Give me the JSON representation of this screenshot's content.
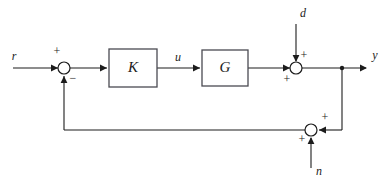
{
  "diagram": {
    "stroke_color": "#1c1c1c",
    "block_border_color": "#4a4a52",
    "background_color": "#ffffff",
    "blocks": [
      {
        "id": "controller",
        "label": "K",
        "x": 109,
        "y": 49,
        "w": 48,
        "h": 38
      },
      {
        "id": "plant",
        "label": "G",
        "x": 202,
        "y": 50,
        "w": 46,
        "h": 36
      }
    ],
    "summing_junctions": [
      {
        "id": "error-sum",
        "cx": 64,
        "cy": 68,
        "r": 6,
        "signs": [
          {
            "text": "+",
            "x": 57,
            "y": 52
          },
          {
            "text": "−",
            "x": 73,
            "y": 79
          }
        ]
      },
      {
        "id": "disturbance-sum",
        "cx": 296,
        "cy": 68,
        "r": 6,
        "signs": [
          {
            "text": "+",
            "x": 304,
            "y": 56
          },
          {
            "text": "+",
            "x": 287,
            "y": 80
          }
        ]
      },
      {
        "id": "noise-sum",
        "cx": 311,
        "cy": 130,
        "r": 6,
        "signs": [
          {
            "text": "+",
            "x": 325,
            "y": 118
          },
          {
            "text": "+",
            "x": 302,
            "y": 140
          }
        ]
      }
    ],
    "branch_points": [
      {
        "id": "output-branch",
        "cx": 342,
        "cy": 68,
        "r": 2.2
      }
    ],
    "signal_labels": [
      {
        "id": "reference",
        "text": "r",
        "x": 14,
        "y": 57
      },
      {
        "id": "control",
        "text": "u",
        "x": 178,
        "y": 58
      },
      {
        "id": "disturbance",
        "text": "d",
        "x": 303,
        "y": 14
      },
      {
        "id": "output",
        "text": "y",
        "x": 375,
        "y": 56
      },
      {
        "id": "noise",
        "text": "n",
        "x": 319,
        "y": 172
      }
    ],
    "wires": [
      {
        "id": "reference-to-sum",
        "points": "13,68 58,68"
      },
      {
        "id": "sum-to-controller",
        "points": "70,68 107,68"
      },
      {
        "id": "controller-to-plant",
        "points": "157,68 200,68"
      },
      {
        "id": "plant-to-disturbance-sum",
        "points": "248,68 290,68"
      },
      {
        "id": "disturbance-in",
        "points": "296,24 296,61"
      },
      {
        "id": "disturbance-sum-to-output",
        "points": "302,68 366,68"
      },
      {
        "id": "output-branch-down",
        "points": "342,68 342,130"
      },
      {
        "id": "branch-to-noise-sum",
        "points": "342,130 319,130"
      },
      {
        "id": "noise-in",
        "points": "311,168 311,138"
      },
      {
        "id": "noise-sum-to-feedback",
        "points": "305,130 64,130"
      },
      {
        "id": "feedback-up-to-error-sum",
        "points": "64,130 64,76"
      }
    ],
    "arrow_heads": [
      {
        "id": "arrow-into-error-sum",
        "x": 58,
        "y": 68,
        "dir": "right"
      },
      {
        "id": "arrow-into-controller",
        "x": 107,
        "y": 68,
        "dir": "right"
      },
      {
        "id": "arrow-into-plant",
        "x": 200,
        "y": 68,
        "dir": "right"
      },
      {
        "id": "arrow-into-disturbance-sum",
        "x": 290,
        "y": 68,
        "dir": "right"
      },
      {
        "id": "arrow-disturbance-down",
        "x": 296,
        "y": 62,
        "dir": "down"
      },
      {
        "id": "arrow-output",
        "x": 367,
        "y": 68,
        "dir": "right"
      },
      {
        "id": "arrow-into-noise-sum-right",
        "x": 319,
        "y": 130,
        "dir": "left"
      },
      {
        "id": "arrow-noise-up",
        "x": 311,
        "y": 137,
        "dir": "up"
      },
      {
        "id": "arrow-feedback-up",
        "x": 64,
        "y": 76,
        "dir": "up"
      }
    ]
  }
}
